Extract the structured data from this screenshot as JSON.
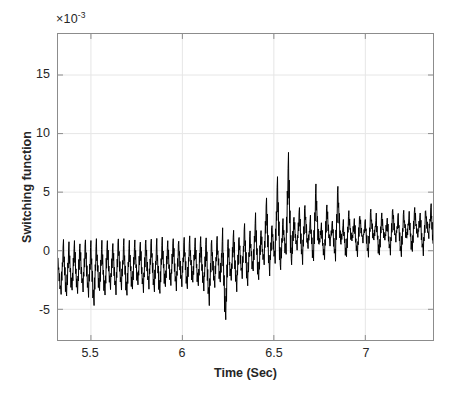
{
  "chart_data": {
    "type": "line",
    "title": "",
    "xlabel": "Time (Sec)",
    "ylabel": "Switching function",
    "y_exponent_label": "×10",
    "y_exponent_power": "-3",
    "y_scale": 0.001,
    "xlim": [
      5.32,
      7.37
    ],
    "ylim": [
      -7.62,
      18.5
    ],
    "xticks": [
      5.5,
      6,
      6.5,
      7
    ],
    "xticklabels": [
      "5.5",
      "6",
      "6.5",
      "7"
    ],
    "yticks": [
      15,
      10,
      5,
      0,
      -5
    ],
    "yticklabels": [
      "15",
      "10",
      "5",
      "0",
      "-5"
    ],
    "grid": true,
    "legend": "none",
    "line_color": "#000000",
    "line_width": 1.0,
    "axis_color": "#8c8c8c",
    "grid_color": "#e6e6e6",
    "text_color": "#262626",
    "background": "#ffffff",
    "series": [
      {
        "name": "Switching function",
        "description": "High-frequency chattering signal; negative-biased low-amplitude band before t=6.2, a large transient burst near t=6.25-6.6 peaking at 7.1e-3 and dipping to -6.0e-3, then a positive-biased band after t=6.6.",
        "x": [
          5.32,
          5.335,
          5.35,
          5.365,
          5.38,
          5.395,
          5.41,
          5.425,
          5.44,
          5.455,
          5.47,
          5.485,
          5.5,
          5.515,
          5.53,
          5.545,
          5.56,
          5.575,
          5.59,
          5.605,
          5.62,
          5.635,
          5.65,
          5.665,
          5.68,
          5.695,
          5.71,
          5.725,
          5.74,
          5.755,
          5.77,
          5.785,
          5.8,
          5.815,
          5.83,
          5.845,
          5.86,
          5.875,
          5.89,
          5.905,
          5.92,
          5.935,
          5.95,
          5.965,
          5.98,
          5.995,
          6.01,
          6.025,
          6.04,
          6.055,
          6.07,
          6.085,
          6.1,
          6.115,
          6.13,
          6.145,
          6.16,
          6.175,
          6.19,
          6.205,
          6.22,
          6.235,
          6.25,
          6.265,
          6.28,
          6.295,
          6.31,
          6.325,
          6.34,
          6.355,
          6.37,
          6.385,
          6.4,
          6.415,
          6.43,
          6.445,
          6.46,
          6.475,
          6.49,
          6.505,
          6.52,
          6.535,
          6.55,
          6.565,
          6.58,
          6.595,
          6.61,
          6.625,
          6.64,
          6.655,
          6.67,
          6.685,
          6.7,
          6.715,
          6.73,
          6.745,
          6.76,
          6.775,
          6.79,
          6.805,
          6.82,
          6.835,
          6.85,
          6.865,
          6.88,
          6.895,
          6.91,
          6.925,
          6.94,
          6.955,
          6.97,
          6.985,
          7.0,
          7.015,
          7.03,
          7.045,
          7.06,
          7.075,
          7.09,
          7.105,
          7.12,
          7.135,
          7.15,
          7.165,
          7.18,
          7.195,
          7.21,
          7.225,
          7.24,
          7.255,
          7.27,
          7.285,
          7.3,
          7.315,
          7.33,
          7.345,
          7.36,
          7.37
        ],
        "y": [
          -1.0,
          -3.6,
          0.2,
          -3.9,
          0.1,
          -3.5,
          0.3,
          -3.7,
          0.2,
          -3.4,
          0.4,
          -3.8,
          0.1,
          -4.6,
          0.3,
          -3.5,
          0.2,
          -3.9,
          0.4,
          -3.3,
          0.2,
          -3.6,
          0.5,
          -3.2,
          0.3,
          -3.8,
          0.2,
          -3.4,
          0.4,
          -3.0,
          0.3,
          -3.5,
          0.5,
          -3.1,
          0.4,
          -3.4,
          0.3,
          -3.7,
          0.5,
          -3.2,
          0.4,
          -3.0,
          0.6,
          -3.3,
          0.4,
          -2.9,
          0.5,
          -3.2,
          0.6,
          -2.8,
          0.5,
          -3.1,
          0.7,
          -3.4,
          0.5,
          -4.5,
          0.4,
          -3.0,
          0.6,
          -2.7,
          0.8,
          -6.0,
          0.5,
          -2.6,
          1.2,
          -3.4,
          0.8,
          -2.2,
          1.6,
          -2.9,
          1.1,
          -1.8,
          2.4,
          -2.6,
          1.4,
          -1.2,
          3.8,
          -2.0,
          1.8,
          -0.9,
          5.2,
          -1.6,
          2.2,
          -0.4,
          7.1,
          -1.3,
          2.6,
          0.1,
          3.2,
          -1.0,
          3.4,
          0.3,
          2.4,
          -0.9,
          4.9,
          0.4,
          2.0,
          -0.8,
          3.6,
          0.5,
          2.2,
          -0.7,
          4.8,
          0.6,
          2.1,
          -0.6,
          3.0,
          0.7,
          2.4,
          -0.5,
          2.8,
          0.8,
          2.3,
          -0.4,
          3.1,
          0.9,
          2.6,
          -0.5,
          2.9,
          0.8,
          2.5,
          -0.3,
          3.3,
          0.9,
          2.7,
          -0.4,
          3.0,
          1.0,
          2.8,
          -0.2,
          3.4,
          1.1,
          2.9,
          -0.3,
          3.2,
          1.2,
          3.5,
          0.6
        ]
      }
    ]
  }
}
